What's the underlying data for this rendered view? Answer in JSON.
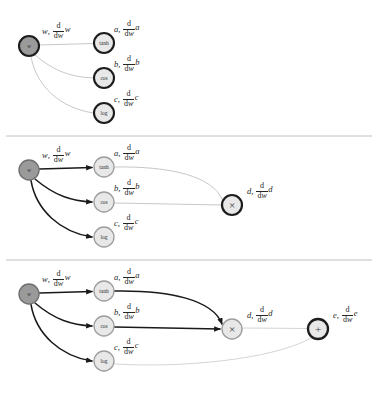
{
  "figure": {
    "background": "#ffffff",
    "width": 382,
    "height": 400
  },
  "colors": {
    "input_node_fill": "#9a9a9a",
    "op_node_fill": "#e8e8e8",
    "ring_dark": "#1d1d1d",
    "ring_mid": "#6f6f6f",
    "ring_light": "#9d9d9d",
    "edge_active": "#1a1a1a",
    "edge_inactive": "#b9b9b9",
    "edge_pending": "#cfcfcf",
    "divider": "#b0b0b0",
    "text": "#262626"
  },
  "glyphs": {
    "multiply": "×",
    "plus": "+"
  },
  "dividers": [
    {
      "y": 136,
      "x1": 6,
      "x2": 372
    },
    {
      "y": 260,
      "x1": 6,
      "x2": 372
    }
  ],
  "panels": [
    {
      "id": "panel-1",
      "caption": "stage-1-inputs-evaluated",
      "nodes": [
        {
          "id": "w",
          "label": "w",
          "kind": "input",
          "cx": 29,
          "cy": 46,
          "r": 10,
          "fill_key": "input_node_fill",
          "ring_key": "ring_dark",
          "ring_w": 2.1,
          "glyph": false
        },
        {
          "id": "tanh",
          "label": "tanh",
          "kind": "op",
          "cx": 104,
          "cy": 43,
          "r": 10,
          "fill_key": "op_node_fill",
          "ring_key": "ring_dark",
          "ring_w": 2.1,
          "glyph": false
        },
        {
          "id": "cos",
          "label": "cos",
          "kind": "op",
          "cx": 104,
          "cy": 78,
          "r": 10,
          "fill_key": "op_node_fill",
          "ring_key": "ring_dark",
          "ring_w": 2.1,
          "glyph": false
        },
        {
          "id": "log",
          "label": "log",
          "kind": "op",
          "cx": 104,
          "cy": 113,
          "r": 10,
          "fill_key": "op_node_fill",
          "ring_key": "ring_dark",
          "ring_w": 2.1,
          "glyph": false
        }
      ],
      "edges": [
        {
          "from": "w",
          "to": "tanh",
          "state": "inactive",
          "arrow": false,
          "path": "M 39.5 45 L 93.5 43.5"
        },
        {
          "from": "w",
          "to": "cos",
          "state": "inactive",
          "arrow": false,
          "path": "M 35 55 C 55 72, 72 77, 93.5 78"
        },
        {
          "from": "w",
          "to": "log",
          "state": "inactive",
          "arrow": false,
          "path": "M 31 56.5 C 36 86, 60 108, 93.5 113"
        }
      ],
      "labels": [
        {
          "for": "w",
          "x": 42,
          "y": 22,
          "lead": "w",
          "tail": "w"
        },
        {
          "for": "tanh",
          "x": 114,
          "y": 20,
          "lead": "a",
          "tail": "a"
        },
        {
          "for": "cos",
          "x": 114,
          "y": 55,
          "lead": "b",
          "tail": "b"
        },
        {
          "for": "log",
          "x": 114,
          "y": 90,
          "lead": "c",
          "tail": "c"
        }
      ]
    },
    {
      "id": "panel-2",
      "caption": "stage-2-product-node-evaluated",
      "nodes": [
        {
          "id": "w",
          "label": "w",
          "kind": "input",
          "cx": 29,
          "cy": 170,
          "r": 10,
          "fill_key": "input_node_fill",
          "ring_key": "ring_mid",
          "ring_w": 1.4,
          "glyph": false
        },
        {
          "id": "tanh",
          "label": "tanh",
          "kind": "op",
          "cx": 104,
          "cy": 167,
          "r": 10,
          "fill_key": "op_node_fill",
          "ring_key": "ring_light",
          "ring_w": 1.3,
          "glyph": false
        },
        {
          "id": "cos",
          "label": "cos",
          "kind": "op",
          "cx": 104,
          "cy": 202,
          "r": 10,
          "fill_key": "op_node_fill",
          "ring_key": "ring_light",
          "ring_w": 1.3,
          "glyph": false
        },
        {
          "id": "log",
          "label": "log",
          "kind": "op",
          "cx": 104,
          "cy": 237,
          "r": 10,
          "fill_key": "op_node_fill",
          "ring_key": "ring_light",
          "ring_w": 1.3,
          "glyph": false
        },
        {
          "id": "mul",
          "label": "×",
          "kind": "op",
          "cx": 232,
          "cy": 205,
          "r": 10,
          "fill_key": "op_node_fill",
          "ring_key": "ring_dark",
          "ring_w": 2.2,
          "glyph": true
        }
      ],
      "edges": [
        {
          "from": "w",
          "to": "tanh",
          "state": "active",
          "arrow": true,
          "path": "M 39.5 169 L 92 167.5"
        },
        {
          "from": "w",
          "to": "cos",
          "state": "active",
          "arrow": true,
          "path": "M 35 179 C 55 196, 72 201, 92 202"
        },
        {
          "from": "w",
          "to": "log",
          "state": "active",
          "arrow": true,
          "path": "M 31 180.5 C 36 210, 60 232, 92 237"
        },
        {
          "from": "tanh",
          "to": "mul",
          "state": "inactive",
          "arrow": false,
          "path": "M 114.5 167 C 170 166, 213 176, 222.5 200"
        },
        {
          "from": "cos",
          "to": "mul",
          "state": "inactive",
          "arrow": false,
          "path": "M 114.5 203 L 221.5 205"
        }
      ],
      "labels": [
        {
          "for": "w",
          "x": 42,
          "y": 146,
          "lead": "w",
          "tail": "w"
        },
        {
          "for": "tanh",
          "x": 114,
          "y": 144,
          "lead": "a",
          "tail": "a"
        },
        {
          "for": "cos",
          "x": 114,
          "y": 179,
          "lead": "b",
          "tail": "b"
        },
        {
          "for": "log",
          "x": 114,
          "y": 214,
          "lead": "c",
          "tail": "c"
        },
        {
          "for": "mul",
          "x": 247,
          "y": 182,
          "lead": "d",
          "tail": "d"
        }
      ]
    },
    {
      "id": "panel-3",
      "caption": "stage-3-sum-node-evaluated",
      "nodes": [
        {
          "id": "w",
          "label": "w",
          "kind": "input",
          "cx": 29,
          "cy": 294,
          "r": 10,
          "fill_key": "input_node_fill",
          "ring_key": "ring_mid",
          "ring_w": 1.4,
          "glyph": false
        },
        {
          "id": "tanh",
          "label": "tanh",
          "kind": "op",
          "cx": 104,
          "cy": 291,
          "r": 10,
          "fill_key": "op_node_fill",
          "ring_key": "ring_light",
          "ring_w": 1.3,
          "glyph": false
        },
        {
          "id": "cos",
          "label": "cos",
          "kind": "op",
          "cx": 104,
          "cy": 326,
          "r": 10,
          "fill_key": "op_node_fill",
          "ring_key": "ring_light",
          "ring_w": 1.3,
          "glyph": false
        },
        {
          "id": "log",
          "label": "log",
          "kind": "op",
          "cx": 104,
          "cy": 361,
          "r": 10,
          "fill_key": "op_node_fill",
          "ring_key": "ring_light",
          "ring_w": 1.3,
          "glyph": false
        },
        {
          "id": "mul",
          "label": "×",
          "kind": "op",
          "cx": 232,
          "cy": 329,
          "r": 10,
          "fill_key": "op_node_fill",
          "ring_key": "ring_light",
          "ring_w": 1.4,
          "glyph": true
        },
        {
          "id": "add",
          "label": "+",
          "kind": "op",
          "cx": 318,
          "cy": 329,
          "r": 10,
          "fill_key": "op_node_fill",
          "ring_key": "ring_dark",
          "ring_w": 2.3,
          "glyph": true
        }
      ],
      "edges": [
        {
          "from": "w",
          "to": "tanh",
          "state": "active",
          "arrow": true,
          "path": "M 39.5 293 L 92 291.5"
        },
        {
          "from": "w",
          "to": "cos",
          "state": "active",
          "arrow": true,
          "path": "M 35 303 C 55 320, 72 325, 92 326"
        },
        {
          "from": "w",
          "to": "log",
          "state": "active",
          "arrow": true,
          "path": "M 31 304.5 C 36 334, 60 356, 92 361"
        },
        {
          "from": "tanh",
          "to": "mul",
          "state": "active",
          "arrow": true,
          "path": "M 114.5 291 C 170 290, 213 300, 222 324"
        },
        {
          "from": "cos",
          "to": "mul",
          "state": "active",
          "arrow": true,
          "path": "M 114.5 327 L 220 329"
        },
        {
          "from": "mul",
          "to": "add",
          "state": "pending",
          "arrow": false,
          "path": "M 242.5 328 L 307.5 328.5"
        },
        {
          "from": "log",
          "to": "add",
          "state": "pending",
          "arrow": false,
          "path": "M 114.5 364 C 180 368, 272 360, 311 338"
        }
      ],
      "labels": [
        {
          "for": "w",
          "x": 42,
          "y": 270,
          "lead": "w",
          "tail": "w"
        },
        {
          "for": "tanh",
          "x": 114,
          "y": 268,
          "lead": "a",
          "tail": "a"
        },
        {
          "for": "cos",
          "x": 114,
          "y": 303,
          "lead": "b",
          "tail": "b"
        },
        {
          "for": "log",
          "x": 114,
          "y": 338,
          "lead": "c",
          "tail": "c"
        },
        {
          "for": "mul",
          "x": 247,
          "y": 306,
          "lead": "d",
          "tail": "d"
        },
        {
          "for": "add",
          "x": 333,
          "y": 306,
          "lead": "e",
          "tail": "e"
        }
      ]
    }
  ],
  "math": {
    "numerator": "d",
    "denominator_d": "d",
    "denominator_var": "w",
    "separator": ","
  }
}
